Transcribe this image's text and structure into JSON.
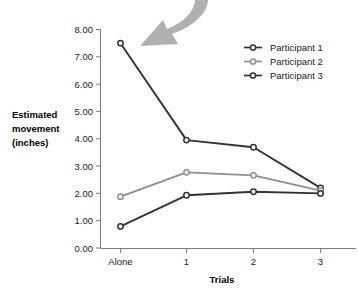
{
  "chart_data": {
    "type": "line",
    "title": "",
    "subtitle": "",
    "xlabel": "Trials",
    "ylabel": "Estimated movement (inches)",
    "ylabel_lines": [
      "Estimated",
      "movement",
      "(inches)"
    ],
    "categories": [
      "Alone",
      "1",
      "2",
      "3"
    ],
    "xtick_labels": [
      "Alone",
      "1",
      "2",
      "3"
    ],
    "ytick_labels": [
      "0.00",
      "1.00",
      "2.00",
      "3.00",
      "4.00",
      "5.00",
      "6.00",
      "7.00",
      "8.00"
    ],
    "ylim": [
      0,
      8
    ],
    "ytick_step": 1,
    "grid": false,
    "legend_position": "top-right",
    "series": [
      {
        "name": "Participant 1",
        "color": "#333333",
        "values": [
          7.5,
          3.95,
          3.69,
          2.2
        ]
      },
      {
        "name": "Participant 2",
        "color": "#8f8f8f",
        "values": [
          1.88,
          2.77,
          2.66,
          2.1
        ]
      },
      {
        "name": "Participant 3",
        "color": "#333333",
        "values": [
          0.79,
          1.93,
          2.06,
          2.0
        ]
      }
    ],
    "annotations": [
      {
        "type": "curved-arrow",
        "name": "callout-arrow",
        "color": "#a8a8a8",
        "points_to_series": "Participant 1",
        "points_to_category": "Alone"
      }
    ]
  },
  "legend": {
    "items": [
      {
        "label": "Participant 1",
        "color": "#333333"
      },
      {
        "label": "Participant 2",
        "color": "#8f8f8f"
      },
      {
        "label": "Participant 3",
        "color": "#333333"
      }
    ]
  },
  "axes": {
    "y_title_line1": "Estimated",
    "y_title_line2": "movement",
    "y_title_line3": "(inches)",
    "x_title": "Trials",
    "y_ticks": [
      "8.00",
      "7.00",
      "6.00",
      "5.00",
      "4.00",
      "3.00",
      "2.00",
      "1.00",
      "0.00"
    ],
    "x_ticks": [
      "Alone",
      "1",
      "2",
      "3"
    ]
  },
  "colors": {
    "background": "#ffffff",
    "axis": "#7d7d7d",
    "text": "#1a1a1a",
    "series_dark": "#333333",
    "series_light": "#8f8f8f",
    "arrow": "#a8a8a8"
  }
}
